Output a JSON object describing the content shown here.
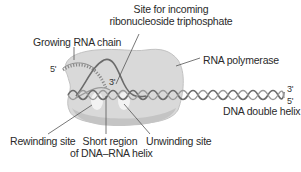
{
  "diagram": {
    "labels": {
      "site_incoming_line1": "Site for incoming",
      "site_incoming_line2": "ribonucleoside triphosphate",
      "growing_rna": "Growing RNA chain",
      "rna_polymerase": "RNA polymerase",
      "dna_double_helix": "DNA double helix",
      "rewinding_site": "Rewinding site",
      "short_region_line1": "Short region",
      "short_region_line2": "of DNA–RNA helix",
      "unwinding_site": "Unwinding site"
    },
    "end_markers": {
      "rna_5prime": "5'",
      "rna_3prime": "3'",
      "dna_right_top": "3'",
      "dna_right_bottom": "5'"
    },
    "colors": {
      "polymerase_fill": "#d9d9d9",
      "polymerase_shadow": "#bdbdbd",
      "helix_strand": "#6b6b6b",
      "helix_strand_light": "#9a9a9a",
      "leader_line": "#555555",
      "text": "#2a2a2a"
    }
  }
}
